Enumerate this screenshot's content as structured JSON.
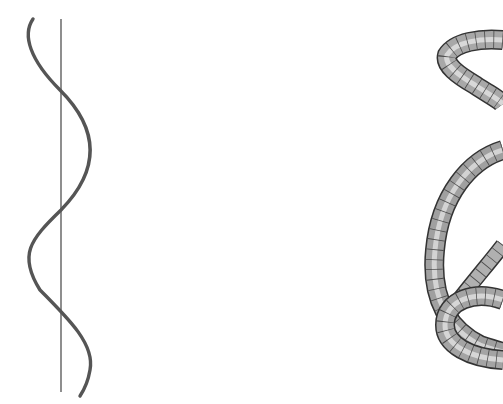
{
  "figure": {
    "background": "#ffffff",
    "panels": [
      {
        "id": "left",
        "description": "planar sinusoidal curve crossing a vertical axis line",
        "axis_color": "#444444",
        "curve_color": "#555555"
      },
      {
        "id": "right",
        "description": "3D shaded tube (knotted helix) rendered with mesh grid, cropped at right edge",
        "tube_fill": "#9a9a9a",
        "mesh_color": "#333333"
      }
    ]
  }
}
